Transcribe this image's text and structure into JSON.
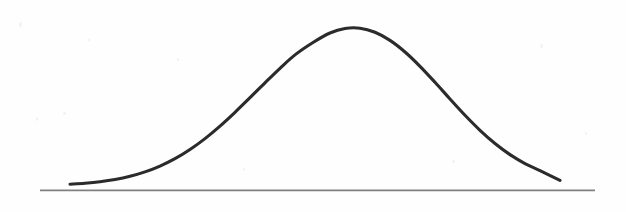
{
  "figure": {
    "title": "Bell Curve (Normal Distribution)",
    "background_color": "#fefefe",
    "width": 626,
    "height": 212
  },
  "chart_data": {
    "type": "line",
    "title": "",
    "subtitle": "",
    "xlabel": "",
    "ylabel": "",
    "grid": false,
    "legend": null,
    "annotations": [],
    "axis": {
      "baseline_visible": true,
      "baseline_color": "#808080",
      "baseline_width_px": 1.6,
      "baseline_x_start_px": 40,
      "baseline_x_end_px": 595,
      "baseline_y_px": 190,
      "ticks": [],
      "tick_labels": []
    },
    "curve": {
      "name": "normal-distribution",
      "color": "#2b2b2b",
      "stroke_width_px": 3.1,
      "fill": "none",
      "linecap": "round",
      "peak_x_px": 313,
      "peak_y_px": 11,
      "left_tail_x_px": 70,
      "right_tail_x_px": 560,
      "tail_y_px": 184,
      "half_max_left_x_px": 215,
      "half_max_right_x_px": 418,
      "mean_px": 313,
      "sigma_px": 86,
      "amplitude_px": 176
    },
    "x": [
      70,
      85,
      100,
      115,
      130,
      145,
      160,
      175,
      190,
      205,
      220,
      235,
      250,
      265,
      280,
      295,
      313,
      330,
      345,
      360,
      375,
      390,
      405,
      420,
      435,
      450,
      465,
      480,
      495,
      510,
      525,
      540,
      560
    ],
    "y": [
      184.2,
      183.2,
      181.7,
      179.5,
      176.3,
      171.9,
      166.1,
      158.7,
      149.5,
      138.6,
      126.1,
      112.3,
      97.7,
      82.8,
      68.3,
      54.9,
      42.5,
      33.0,
      28.5,
      28.2,
      32.3,
      40.4,
      52.0,
      66.3,
      82.3,
      99.0,
      115.3,
      130.3,
      143.5,
      154.6,
      163.6,
      170.6,
      180.4
    ],
    "xlim": [
      40,
      595
    ],
    "ylim": [
      190,
      0
    ]
  }
}
